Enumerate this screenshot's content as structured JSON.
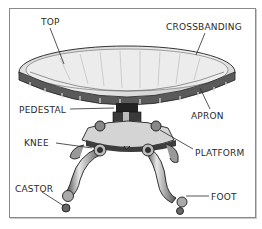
{
  "diagram": {
    "labels": [
      {
        "id": "top",
        "text": "TOP",
        "x": 41,
        "y": 17
      },
      {
        "id": "crossbanding",
        "text": "CROSSBANDING",
        "x": 166,
        "y": 22
      },
      {
        "id": "apron",
        "text": "APRON",
        "x": 191,
        "y": 111
      },
      {
        "id": "pedestal",
        "text": "PEDESTAL",
        "x": 19,
        "y": 105
      },
      {
        "id": "knee",
        "text": "KNEE",
        "x": 24,
        "y": 138
      },
      {
        "id": "platform",
        "text": "PLATFORM",
        "x": 195,
        "y": 148
      },
      {
        "id": "castor",
        "text": "CASTOR",
        "x": 15,
        "y": 184
      },
      {
        "id": "foot",
        "text": "FOOT",
        "x": 211,
        "y": 192
      }
    ],
    "colors": {
      "ink": "#2a2a2a",
      "frame": "#8a8a8a",
      "background": "#ffffff"
    }
  }
}
